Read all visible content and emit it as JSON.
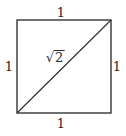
{
  "diagram": {
    "square": {
      "x1": 17,
      "y1": 20,
      "x2": 111,
      "y2": 113,
      "stroke": "#333333"
    },
    "diagonal": {
      "from": [
        17,
        113
      ],
      "to": [
        111,
        20
      ],
      "stroke": "#333333"
    },
    "labels": {
      "top": "1",
      "bottom": "1",
      "left": "1",
      "right": "1",
      "diagonal_symbol": "√",
      "diagonal_radicand": "2"
    },
    "text_color": "#2a2a2a"
  }
}
